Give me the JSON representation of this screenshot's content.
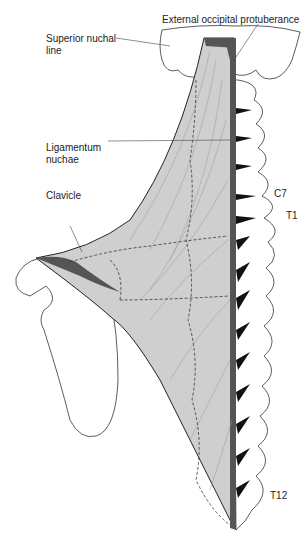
{
  "figure": {
    "colors": {
      "muscle_fill": "#cfcfcf",
      "tendon_dark": "#555555",
      "bone_outline": "#333333",
      "background": "#ffffff"
    }
  },
  "labels": {
    "external_occipital_protuberance": "External occipital protuberance",
    "superior_nuchal_line_1": "Superior nuchal",
    "superior_nuchal_line_2": "line",
    "ligamentum_nuchae_1": "Ligamentum",
    "ligamentum_nuchae_2": "nuchae",
    "clavicle": "Clavicle",
    "c7": "C7",
    "t1": "T1",
    "t12": "T12"
  }
}
